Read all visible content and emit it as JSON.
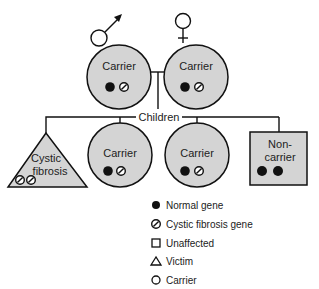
{
  "diagram": {
    "colors": {
      "fill": "#d4d4d4",
      "stroke": "#111111",
      "gene": "#111111",
      "background": "#ffffff"
    },
    "parents": {
      "father": {
        "sex_symbol": "male-symbol",
        "label": "Carrier",
        "genes": [
          "normal",
          "cf"
        ]
      },
      "mother": {
        "sex_symbol": "female-symbol",
        "label": "Carrier",
        "genes": [
          "normal",
          "cf"
        ]
      }
    },
    "children_label": "Children",
    "children": [
      {
        "shape": "triangle",
        "label_line1": "Cystic",
        "label_line2": "fibrosis",
        "genes": [
          "cf",
          "cf"
        ]
      },
      {
        "shape": "circle",
        "label": "Carrier",
        "genes": [
          "normal",
          "cf"
        ]
      },
      {
        "shape": "circle",
        "label": "Carrier",
        "genes": [
          "normal",
          "cf"
        ]
      },
      {
        "shape": "square",
        "label_line1": "Non-",
        "label_line2": "carrier",
        "genes": [
          "normal",
          "normal"
        ]
      }
    ],
    "legend": [
      {
        "icon": "filled-circle",
        "label": "Normal gene"
      },
      {
        "icon": "slashed-circle",
        "label": "Cystic fibrosis gene"
      },
      {
        "icon": "square",
        "label": "Unaffected"
      },
      {
        "icon": "triangle",
        "label": "Victim"
      },
      {
        "icon": "circle",
        "label": "Carrier"
      }
    ]
  }
}
